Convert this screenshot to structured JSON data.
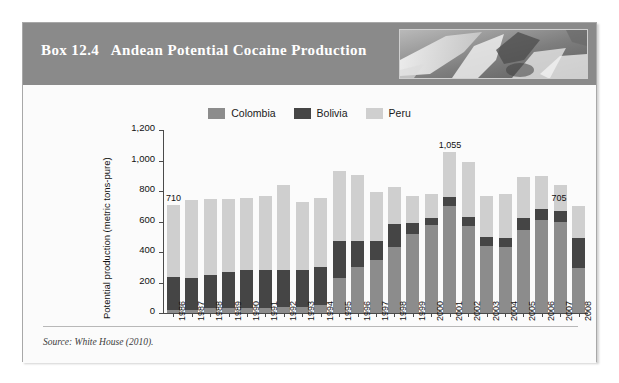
{
  "box": {
    "title": "Box 12.4   Andean Potential Cocaine Production",
    "header_image_name": "andean-photo",
    "source": "Source: White House (2010)."
  },
  "colors": {
    "colombia": "#8c8c8c",
    "bolivia": "#454545",
    "peru": "#cfcfcf",
    "header_band": "#8a8a8a",
    "box_background": "#fbfbfb",
    "box_border": "#a8a8a8",
    "axis": "#4a4a4a"
  },
  "chart_data": {
    "type": "bar",
    "subtype": "stacked",
    "title": "Andean Potential Cocaine Production",
    "xlabel": "",
    "ylabel": "Potential production (metric tons-pure)",
    "ylim": [
      0,
      1200
    ],
    "yticks": [
      0,
      200,
      400,
      600,
      800,
      1000,
      1200
    ],
    "ytick_labels": [
      "0",
      "200",
      "400",
      "600",
      "800",
      "1,000",
      "1,200"
    ],
    "grid": false,
    "legend_position": "top-center",
    "categories": [
      "1986",
      "1987",
      "1988",
      "1989",
      "1990",
      "1991",
      "1992",
      "1993",
      "1994",
      "1995",
      "1996",
      "1997",
      "1998",
      "1999",
      "2000",
      "2001",
      "2002",
      "2003",
      "2004",
      "2005",
      "2006",
      "2007",
      "2008"
    ],
    "series": [
      {
        "name": "Colombia",
        "color": "#8c8c8c",
        "values": [
          20,
          20,
          30,
          30,
          30,
          30,
          40,
          40,
          50,
          230,
          300,
          350,
          435,
          520,
          580,
          700,
          570,
          440,
          430,
          545,
          610,
          600,
          295
        ]
      },
      {
        "name": "Bolivia",
        "color": "#454545",
        "values": [
          215,
          210,
          220,
          240,
          250,
          250,
          240,
          240,
          255,
          240,
          170,
          120,
          150,
          70,
          45,
          60,
          60,
          60,
          60,
          80,
          70,
          70,
          195
        ]
      },
      {
        "name": "Peru",
        "color": "#cfcfcf",
        "values": [
          475,
          510,
          500,
          480,
          475,
          490,
          560,
          450,
          450,
          460,
          435,
          325,
          240,
          175,
          155,
          295,
          360,
          270,
          290,
          270,
          220,
          170,
          215
        ]
      }
    ],
    "totals": [
      710,
      740,
      750,
      750,
      755,
      770,
      840,
      730,
      755,
      930,
      905,
      795,
      825,
      765,
      780,
      1055,
      990,
      770,
      780,
      895,
      900,
      840,
      705
    ],
    "annotations": [
      {
        "label": "710",
        "category": "1986",
        "value": 710
      },
      {
        "label": "1,055",
        "category": "2001",
        "value": 1055
      },
      {
        "label": "705",
        "category": "2008",
        "value": 705
      }
    ]
  },
  "legend": [
    {
      "label": "Colombia",
      "swatch_name": "legend-swatch-colombia"
    },
    {
      "label": "Bolivia",
      "swatch_name": "legend-swatch-bolivia"
    },
    {
      "label": "Peru",
      "swatch_name": "legend-swatch-peru"
    }
  ]
}
